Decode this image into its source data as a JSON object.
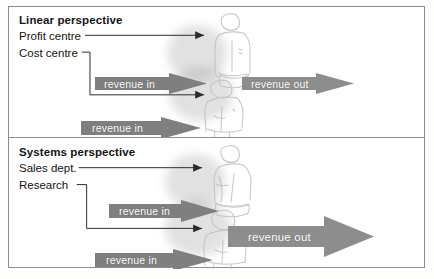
{
  "figure": {
    "type": "conceptual-diagram",
    "panels": [
      {
        "id": "linear",
        "title": "Linear perspective",
        "labels": [
          {
            "text": "Profit centre",
            "points_to": "top-figure"
          },
          {
            "text": "Cost centre",
            "points_to": "middle-figure"
          }
        ],
        "arrows": [
          {
            "id": "revenue-in-upper",
            "text": "revenue in",
            "direction": "right",
            "size": "small"
          },
          {
            "id": "revenue-in-lower",
            "text": "revenue in",
            "direction": "right",
            "size": "small"
          },
          {
            "id": "revenue-out",
            "text": "revenue out",
            "direction": "right",
            "size": "small"
          }
        ],
        "illustration": "stacked-human-figures-sketch"
      },
      {
        "id": "systems",
        "title": "Systems perspective",
        "labels": [
          {
            "text": "Sales dept.",
            "points_to": "top-figure"
          },
          {
            "text": "Research",
            "points_to": "middle-figure"
          }
        ],
        "arrows": [
          {
            "id": "revenue-in-upper",
            "text": "revenue in",
            "direction": "right",
            "size": "small"
          },
          {
            "id": "revenue-in-lower",
            "text": "revenue in",
            "direction": "right",
            "size": "small"
          },
          {
            "id": "revenue-out",
            "text": "revenue out",
            "direction": "right",
            "size": "large"
          }
        ],
        "illustration": "stacked-human-figures-sketch"
      }
    ]
  },
  "colors": {
    "page_background": "#ffffff",
    "frame_border": "#8d8d8d",
    "text": "#141414",
    "arrow_fill": "#8a8a8a",
    "arrow_fill_dark": "#6f6f6f",
    "arrow_text": "#ffffff",
    "leader_line": "#2b2b2b",
    "sketch_line": "#b9b9b9"
  }
}
